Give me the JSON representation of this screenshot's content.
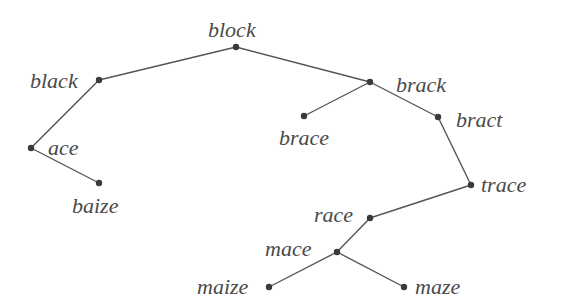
{
  "diagram": {
    "type": "tree",
    "colors": {
      "edge": "#555555",
      "node": "#3a3a3a",
      "text": "#4a4a4a",
      "background": "#ffffff"
    },
    "nodes": [
      {
        "id": "block",
        "label": "block",
        "x": 236,
        "y": 47,
        "label_x": 208,
        "label_y": 37
      },
      {
        "id": "black",
        "label": "black",
        "x": 99,
        "y": 80,
        "label_x": 30,
        "label_y": 88
      },
      {
        "id": "ace",
        "label": "ace",
        "x": 31,
        "y": 148,
        "label_x": 48,
        "label_y": 155
      },
      {
        "id": "baize",
        "label": "baize",
        "x": 99,
        "y": 183,
        "label_x": 72,
        "label_y": 213
      },
      {
        "id": "brack",
        "label": "brack",
        "x": 370,
        "y": 82,
        "label_x": 396,
        "label_y": 92
      },
      {
        "id": "brace",
        "label": "brace",
        "x": 304,
        "y": 116,
        "label_x": 279,
        "label_y": 145
      },
      {
        "id": "bract",
        "label": "bract",
        "x": 438,
        "y": 117,
        "label_x": 456,
        "label_y": 127
      },
      {
        "id": "trace",
        "label": "trace",
        "x": 471,
        "y": 185,
        "label_x": 481,
        "label_y": 192
      },
      {
        "id": "race",
        "label": "race",
        "x": 370,
        "y": 218,
        "label_x": 314,
        "label_y": 222
      },
      {
        "id": "mace",
        "label": "mace",
        "x": 337,
        "y": 252,
        "label_x": 265,
        "label_y": 256
      },
      {
        "id": "maize",
        "label": "maize",
        "x": 269,
        "y": 287,
        "label_x": 197,
        "label_y": 294
      },
      {
        "id": "maze",
        "label": "maze",
        "x": 404,
        "y": 287,
        "label_x": 415,
        "label_y": 294
      }
    ],
    "edges": [
      {
        "from": "block",
        "to": "black"
      },
      {
        "from": "block",
        "to": "brack"
      },
      {
        "from": "black",
        "to": "ace"
      },
      {
        "from": "ace",
        "to": "baize"
      },
      {
        "from": "brack",
        "to": "brace"
      },
      {
        "from": "brack",
        "to": "bract"
      },
      {
        "from": "bract",
        "to": "trace"
      },
      {
        "from": "trace",
        "to": "race"
      },
      {
        "from": "race",
        "to": "mace"
      },
      {
        "from": "mace",
        "to": "maize"
      },
      {
        "from": "mace",
        "to": "maze"
      }
    ]
  }
}
